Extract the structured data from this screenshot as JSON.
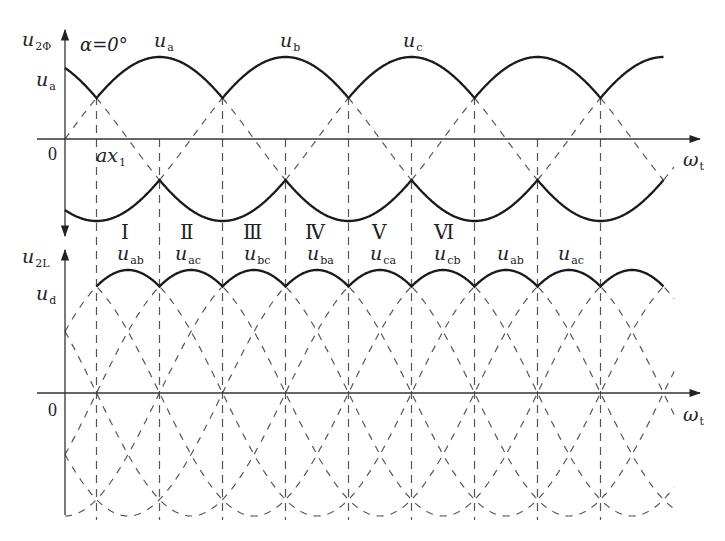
{
  "figure": {
    "colors": {
      "curve": "#1a1a1a",
      "dashed": "#555555",
      "axis": "#333333",
      "background": "#ffffff"
    },
    "upper_plot": {
      "y_axis_label": {
        "main": "u",
        "sub": "2Φ"
      },
      "x_axis_label": {
        "main": "ω",
        "sub": "t"
      },
      "origin_label": "0",
      "alpha_label": "α=0°",
      "envelope_label": {
        "main": "u",
        "sub": "a"
      },
      "crossing_label": {
        "main": "ax",
        "sub": "1"
      },
      "phase_labels": [
        {
          "main": "u",
          "sub": "a"
        },
        {
          "main": "u",
          "sub": "b"
        },
        {
          "main": "u",
          "sub": "c"
        }
      ]
    },
    "segments": [
      {
        "roman": "Ⅰ",
        "main": "u",
        "sub": "ab"
      },
      {
        "roman": "Ⅱ",
        "main": "u",
        "sub": "ac"
      },
      {
        "roman": "Ⅲ",
        "main": "u",
        "sub": "bc"
      },
      {
        "roman": "Ⅳ",
        "main": "u",
        "sub": "ba"
      },
      {
        "roman": "Ⅴ",
        "main": "u",
        "sub": "ca"
      },
      {
        "roman": "Ⅵ",
        "main": "u",
        "sub": "cb"
      },
      {
        "roman": "",
        "main": "u",
        "sub": "ab"
      },
      {
        "roman": "",
        "main": "u",
        "sub": "ac"
      }
    ],
    "lower_plot": {
      "y_axis_label": {
        "main": "u",
        "sub": "2L"
      },
      "x_axis_label": {
        "main": "ω",
        "sub": "t"
      },
      "origin_label": "0",
      "envelope_label": {
        "main": "u",
        "sub": "d"
      }
    }
  },
  "chart_data": {
    "type": "line",
    "subplots": [
      {
        "name": "phase voltages",
        "ylabel": "u2Φ",
        "xlabel": "ωt",
        "series": [
          {
            "name": "ua",
            "form": "sin",
            "phase_deg": 0
          },
          {
            "name": "ub",
            "form": "sin",
            "phase_deg": -120
          },
          {
            "name": "uc",
            "form": "sin",
            "phase_deg": 120
          }
        ],
        "solid": "positive and negative envelopes",
        "annotations": [
          "α=0°",
          "ax1 (natural commutation point)",
          "ua",
          "ub",
          "uc"
        ]
      },
      {
        "name": "line voltages",
        "ylabel": "u2L",
        "xlabel": "ωt",
        "series": [
          "uab",
          "uac",
          "ubc",
          "uba",
          "uca",
          "ucb"
        ],
        "solid": "ud envelope",
        "intervals": [
          "I: uab",
          "II: uac",
          "III: ubc",
          "IV: uba",
          "V: uca",
          "VI: ucb",
          "uab",
          "uac"
        ]
      }
    ]
  }
}
